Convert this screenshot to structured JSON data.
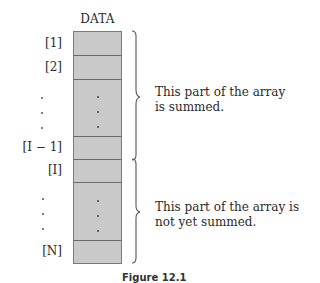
{
  "diagram": {
    "title": "DATA",
    "index_labels": {
      "first": "[1]",
      "second": "[2]",
      "i_minus_1": "[I − 1]",
      "i": "[I]",
      "last": "[N]"
    },
    "cells": [
      {
        "label": "[1]",
        "type": "element"
      },
      {
        "label": "[2]",
        "type": "element"
      },
      {
        "label": "⋮",
        "type": "ellipsis"
      },
      {
        "label": "[I − 1]",
        "type": "element"
      },
      {
        "label": "[I]",
        "type": "element"
      },
      {
        "label": "⋮",
        "type": "ellipsis"
      },
      {
        "label": "[N]",
        "type": "element"
      }
    ],
    "regions": [
      {
        "name": "summed",
        "from": "[1]",
        "to": "[I − 1]",
        "line1": "This part of the array",
        "line2": "is summed."
      },
      {
        "name": "not-summed",
        "from": "[I]",
        "to": "[N]",
        "line1": "This part of the array is",
        "line2": "not yet summed."
      }
    ],
    "caption": "Figure 12.1"
  },
  "colors": {
    "cell_fill": "#c9c9c9",
    "cell_border": "#6a6a6a",
    "text": "#2a2a2a",
    "brace": "#555555"
  }
}
